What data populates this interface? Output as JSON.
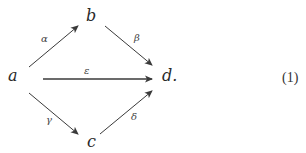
{
  "diagram": {
    "nodes": {
      "a": "a",
      "b": "b",
      "c": "c",
      "d": "d."
    },
    "edges": [
      {
        "from": "a",
        "to": "b",
        "label": "α"
      },
      {
        "from": "b",
        "to": "d",
        "label": "β"
      },
      {
        "from": "a",
        "to": "d",
        "label": "ε"
      },
      {
        "from": "a",
        "to": "c",
        "label": "γ"
      },
      {
        "from": "c",
        "to": "d",
        "label": "δ"
      }
    ],
    "equation_number": "(1)",
    "colors": {
      "arrow": "#3a3a3a",
      "text": "#2a2a2a"
    }
  }
}
